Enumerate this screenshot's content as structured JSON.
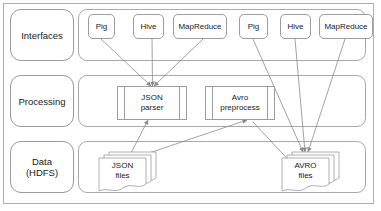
{
  "diagram": {
    "stroke_color": "#9d9d9d",
    "frame_color": "#aeaeae",
    "text_color": "#1a1a1a",
    "background": "#ffffff"
  },
  "tiers": [
    {
      "id": "interfaces",
      "label": "Interfaces"
    },
    {
      "id": "processing",
      "label": "Processing"
    },
    {
      "id": "data",
      "label": "Data\n(HDFS)",
      "label_line1": "Data",
      "label_line2": "(HDFS)"
    }
  ],
  "interfaces": [
    {
      "id": "pig-left",
      "label": "Pig",
      "pipeline": "json"
    },
    {
      "id": "hive-left",
      "label": "Hive",
      "pipeline": "json"
    },
    {
      "id": "mapreduce-left",
      "label": "MapReduce",
      "pipeline": "json"
    },
    {
      "id": "pig-right",
      "label": "Pig",
      "pipeline": "avro"
    },
    {
      "id": "hive-right",
      "label": "Hive",
      "pipeline": "avro"
    },
    {
      "id": "mapreduce-right",
      "label": "MapReduce",
      "pipeline": "avro"
    }
  ],
  "processing": [
    {
      "id": "json-parser",
      "line1": "JSON",
      "line2": "parser"
    },
    {
      "id": "avro-preprocess",
      "line1": "Avro",
      "line2": "preprocess"
    }
  ],
  "data_stores": [
    {
      "id": "json-files",
      "line1": "JSON",
      "line2": "files"
    },
    {
      "id": "avro-files",
      "line1": "AVRO",
      "line2": "files"
    }
  ],
  "connections": [
    {
      "from": "pig-left",
      "to": "json-parser",
      "type": "arrow"
    },
    {
      "from": "hive-left",
      "to": "json-parser",
      "type": "arrow"
    },
    {
      "from": "mapreduce-left",
      "to": "json-parser",
      "type": "arrow"
    },
    {
      "from": "json-files",
      "to": "json-parser",
      "type": "arrow"
    },
    {
      "from": "json-files",
      "to": "avro-preprocess",
      "type": "arrow"
    },
    {
      "from": "avro-preprocess",
      "to": "avro-files",
      "type": "arrow"
    },
    {
      "from": "pig-right",
      "to": "avro-files",
      "type": "arrow"
    },
    {
      "from": "hive-right",
      "to": "avro-files",
      "type": "arrow"
    },
    {
      "from": "mapreduce-right",
      "to": "avro-files",
      "type": "arrow"
    }
  ]
}
